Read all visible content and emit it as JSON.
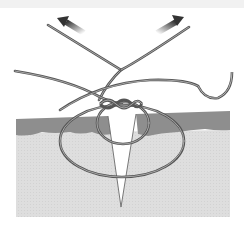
{
  "figure": {
    "elements": [
      "skin-epidermis-layer",
      "dermis-layer",
      "wound-incision",
      "suture-loops",
      "suture-knot",
      "curved-needle",
      "pull-arrows"
    ]
  },
  "colors": {
    "background": "#ffffff",
    "top_band": "#f1f1f1",
    "epidermis": "#8f8f8f",
    "dermis": "#dcdcdc",
    "suture_outer": "#555555",
    "suture_inner": "#b5b5b5",
    "arrow": "#444444"
  }
}
